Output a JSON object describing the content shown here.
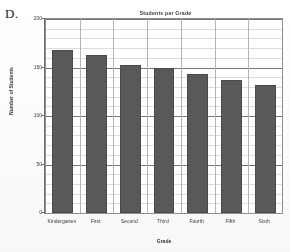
{
  "figure": {
    "label": "D."
  },
  "chart_data": {
    "type": "bar",
    "title": "Students per Grade",
    "xlabel": "Grade",
    "ylabel": "Number of Students",
    "categories": [
      "Kindergarten",
      "First",
      "Second",
      "Third",
      "Fourth",
      "Fifth",
      "Sixth"
    ],
    "values": [
      168,
      163,
      153,
      149,
      143,
      137,
      132
    ],
    "ylim": [
      0,
      200
    ],
    "ytick_labels": [
      "0",
      "50",
      "100",
      "150",
      "200"
    ],
    "ytick_values": [
      0,
      50,
      100,
      150,
      200
    ],
    "minor_tick_step": 10,
    "grid": true,
    "legend": null,
    "bar_color": "#59595a",
    "plot_background": "#ffffff",
    "axis_color": "#6e6e6e"
  }
}
